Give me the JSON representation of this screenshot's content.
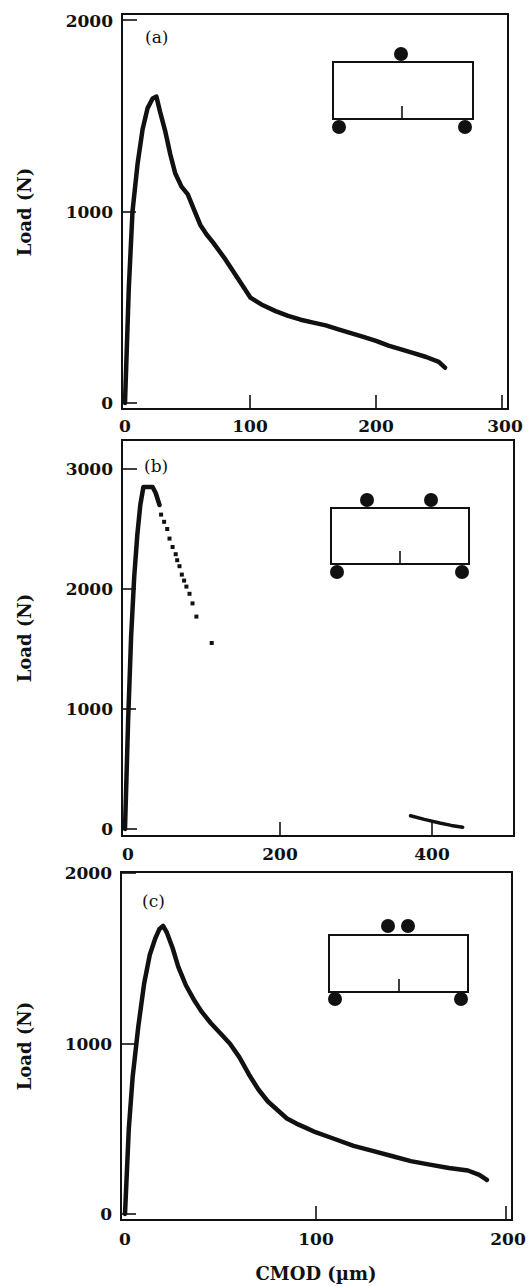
{
  "figure": {
    "xlabel": "CMOD (µm)",
    "ylabel": "Load (N)"
  },
  "chart_data": [
    {
      "type": "line",
      "panel": "(a)",
      "title": "",
      "xlabel": "",
      "ylabel": "Load (N)",
      "xlim": [
        0,
        300
      ],
      "ylim": [
        0,
        2000
      ],
      "xticks": [
        0,
        100,
        200,
        300
      ],
      "yticks": [
        0,
        1000,
        2000
      ],
      "grid": false,
      "inset": "three-point bending beam: one load roller at top center, two support rollers at bottom ends, center notch",
      "series": [
        {
          "name": "load-CMOD",
          "style": "solid",
          "x": [
            0,
            3,
            6,
            10,
            14,
            18,
            22,
            25,
            28,
            32,
            36,
            40,
            45,
            50,
            55,
            60,
            65,
            70,
            80,
            90,
            100,
            110,
            120,
            130,
            140,
            150,
            160,
            170,
            180,
            190,
            200,
            210,
            220,
            230,
            240,
            250,
            255
          ],
          "y": [
            0,
            600,
            1000,
            1250,
            1430,
            1540,
            1590,
            1600,
            1520,
            1420,
            1300,
            1200,
            1130,
            1090,
            1010,
            930,
            880,
            840,
            750,
            650,
            550,
            510,
            480,
            455,
            435,
            420,
            405,
            385,
            365,
            345,
            325,
            300,
            280,
            260,
            240,
            215,
            185
          ]
        }
      ]
    },
    {
      "type": "line",
      "panel": "(b)",
      "title": "",
      "xlabel": "",
      "ylabel": "Load (N)",
      "xlim": [
        0,
        480
      ],
      "ylim": [
        0,
        3000
      ],
      "xticks": [
        0,
        200,
        400
      ],
      "yticks": [
        0,
        1000,
        2000,
        3000
      ],
      "grid": false,
      "inset": "four-point bending beam: two load rollers on top, two support rollers at bottom ends, center notch",
      "series": [
        {
          "name": "pre-peak (solid)",
          "style": "solid",
          "x": [
            0,
            4,
            8,
            12,
            16,
            20,
            24,
            28,
            32,
            36,
            40,
            45
          ],
          "y": [
            0,
            900,
            1600,
            2100,
            2450,
            2700,
            2850,
            2850,
            2850,
            2850,
            2800,
            2700
          ]
        },
        {
          "name": "post-peak (dotted)",
          "style": "dots",
          "x": [
            47,
            51,
            55,
            58,
            62,
            66,
            68,
            71,
            74,
            77,
            80,
            84,
            88,
            93,
            113
          ],
          "y": [
            2620,
            2560,
            2500,
            2420,
            2350,
            2290,
            2240,
            2190,
            2120,
            2070,
            2020,
            1960,
            1880,
            1770,
            1550
          ]
        },
        {
          "name": "tail segment",
          "style": "solid",
          "x": [
            372,
            390,
            410,
            425,
            440
          ],
          "y": [
            110,
            80,
            50,
            30,
            15
          ]
        }
      ]
    },
    {
      "type": "line",
      "panel": "(c)",
      "title": "",
      "xlabel": "CMOD (µm)",
      "ylabel": "Load (N)",
      "xlim": [
        0,
        200
      ],
      "ylim": [
        0,
        2000
      ],
      "xticks": [
        0,
        100,
        200
      ],
      "yticks": [
        0,
        1000,
        2000
      ],
      "grid": false,
      "inset": "beam with two closely spaced load rollers at top center, two support rollers at bottom ends, center notch",
      "series": [
        {
          "name": "load-CMOD",
          "style": "solid",
          "x": [
            0,
            2,
            4,
            7,
            10,
            13,
            16,
            18,
            20,
            22,
            25,
            28,
            32,
            36,
            40,
            45,
            50,
            55,
            60,
            65,
            70,
            75,
            80,
            85,
            90,
            95,
            100,
            110,
            120,
            130,
            140,
            150,
            160,
            170,
            180,
            186,
            190
          ],
          "y": [
            0,
            500,
            800,
            1100,
            1350,
            1520,
            1620,
            1670,
            1690,
            1650,
            1560,
            1450,
            1340,
            1260,
            1190,
            1120,
            1060,
            1000,
            920,
            820,
            730,
            660,
            610,
            560,
            530,
            505,
            480,
            440,
            400,
            370,
            340,
            310,
            290,
            270,
            255,
            230,
            200
          ]
        }
      ]
    }
  ],
  "panels": [
    {
      "tag": "(a)",
      "xtick_labels": [
        "0",
        "100",
        "200",
        "300"
      ],
      "ytick_labels": [
        "0",
        "1000",
        "2000"
      ],
      "ylabel": "Load (N)"
    },
    {
      "tag": "(b)",
      "xtick_labels": [
        "0",
        "200",
        "400"
      ],
      "ytick_labels": [
        "0",
        "1000",
        "2000",
        "3000"
      ],
      "ylabel": "Load (N)"
    },
    {
      "tag": "(c)",
      "xtick_labels": [
        "0",
        "100",
        "200"
      ],
      "ytick_labels": [
        "0",
        "1000",
        "2000"
      ],
      "ylabel": "Load (N)",
      "xlabel": "CMOD (µm)"
    }
  ]
}
